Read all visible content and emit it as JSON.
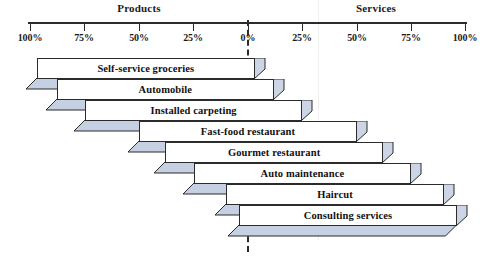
{
  "chart_data": {
    "type": "bar",
    "title": "",
    "subtitle": "",
    "orientation": "horizontal",
    "style": "product-service continuum / tangibility spectrum",
    "groups": [
      "Products",
      "Services"
    ],
    "xlabel": "",
    "ylabel": "",
    "axis": {
      "left_group": "Products",
      "right_group": "Services",
      "center_value": "0%",
      "tick_labels": [
        "100%",
        "75%",
        "50%",
        "25%",
        "0%",
        "25%",
        "50%",
        "75%",
        "100%"
      ],
      "tick_percents": [
        -100,
        -75,
        -50,
        -25,
        0,
        25,
        50,
        75,
        100
      ],
      "range": [
        -100,
        100
      ],
      "grid": false,
      "center_line": "dashed"
    },
    "categories": [
      "Self-service groceries",
      "Automobile",
      "Installed carpeting",
      "Fast-food restaurant",
      "Gourmet restaurant",
      "Auto maintenance",
      "Haircut",
      "Consulting services"
    ],
    "series": [
      {
        "name": "Products",
        "values": [
          97,
          88,
          75,
          50,
          38,
          25,
          10,
          4
        ]
      },
      {
        "name": "Services",
        "values": [
          3,
          12,
          25,
          50,
          62,
          75,
          90,
          96
        ]
      }
    ],
    "bars": [
      {
        "label": "Self-service groceries",
        "products_pct": 97,
        "services_pct": 3
      },
      {
        "label": "Automobile",
        "products_pct": 88,
        "services_pct": 12
      },
      {
        "label": "Installed carpeting",
        "products_pct": 75,
        "services_pct": 25
      },
      {
        "label": "Fast-food restaurant",
        "products_pct": 50,
        "services_pct": 50
      },
      {
        "label": "Gourmet restaurant",
        "products_pct": 38,
        "services_pct": 62
      },
      {
        "label": "Auto maintenance",
        "products_pct": 25,
        "services_pct": 75
      },
      {
        "label": "Haircut",
        "products_pct": 10,
        "services_pct": 90
      },
      {
        "label": "Consulting services",
        "products_pct": 4,
        "services_pct": 96
      }
    ],
    "legend": {
      "visible": false,
      "position": "none"
    }
  },
  "colors": {
    "bar_face": "#ffffff",
    "bar_outline": "#2b2b2b",
    "bar_3d_side": "#ccd5e6",
    "bar_3d_shadow": "#c6d0e3",
    "axis": "#2b2b2b",
    "text": "#1a1a1a",
    "background": "#ffffff",
    "faint_guide": "#f0f0f0"
  },
  "header": {
    "products": "Products",
    "services": "Services"
  },
  "ticks": [
    {
      "label": "100%",
      "x": 30
    },
    {
      "label": "75%",
      "x": 84
    },
    {
      "label": "50%",
      "x": 139
    },
    {
      "label": "25%",
      "x": 193
    },
    {
      "label": "0%",
      "x": 248
    },
    {
      "label": "25%",
      "x": 302
    },
    {
      "label": "50%",
      "x": 357
    },
    {
      "label": "75%",
      "x": 411
    },
    {
      "label": "100%",
      "x": 465
    }
  ]
}
